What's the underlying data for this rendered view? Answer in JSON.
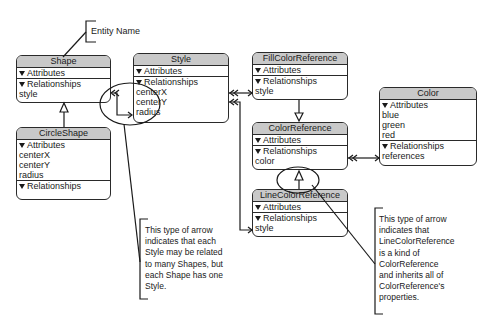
{
  "annotations": {
    "entity_name_label": "Entity Name",
    "relationship_note": "This type of arrow indicates that each Style may be related to many Shapes, but each Shape has one Style.",
    "relationship_note_lines": [
      "This type of arrow",
      "indicates that each",
      "Style may be related",
      "to many Shapes, but",
      "each Shape has one",
      "Style."
    ],
    "inheritance_note_lines": [
      "This type of arrow",
      "indicates that",
      "LineColorReference",
      "is a kind of",
      "ColorReference",
      "and inherits all of",
      "ColorReference's",
      "properties."
    ]
  },
  "section_labels": {
    "attributes": "Attributes",
    "relationships": "Relationships"
  },
  "entities": {
    "shape": {
      "name": "Shape",
      "attributes": [],
      "relationships": [
        "style"
      ]
    },
    "circle_shape": {
      "name": "CircleShape",
      "attributes": [
        "centerX",
        "centerY",
        "radius"
      ],
      "relationships": []
    },
    "style": {
      "name": "Style",
      "attributes": [],
      "relationships": [
        "centerX",
        "centerY",
        "radius"
      ]
    },
    "fill_color_reference": {
      "name": "FillColorReference",
      "attributes": [],
      "relationships": [
        "style"
      ]
    },
    "color_reference": {
      "name": "ColorReference",
      "attributes": [],
      "relationships": [
        "color"
      ]
    },
    "line_color_reference": {
      "name": "LineColorReference",
      "attributes": [],
      "relationships": [
        "style"
      ]
    },
    "color": {
      "name": "Color",
      "attributes": [
        "blue",
        "green",
        "red"
      ],
      "relationships": [
        "references"
      ]
    }
  },
  "colors": {
    "header_fill": "#c9c9c9",
    "stroke": "#2a2a2a",
    "background": "#ffffff"
  }
}
